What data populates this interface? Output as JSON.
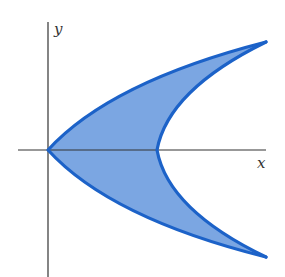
{
  "figure": {
    "type": "region-between-curves",
    "axes": {
      "x_label": "x",
      "y_label": "y"
    },
    "colors": {
      "region_fill": "#7ba6e2",
      "curve_stroke": "#1c62c8",
      "axis_stroke": "#333333",
      "background": "#ffffff"
    },
    "curves": [
      {
        "name": "outer-curve",
        "description": "left parabola opening right, vertex at origin"
      },
      {
        "name": "inner-curve",
        "description": "right parabola opening right, vertex on positive x-axis"
      }
    ]
  }
}
